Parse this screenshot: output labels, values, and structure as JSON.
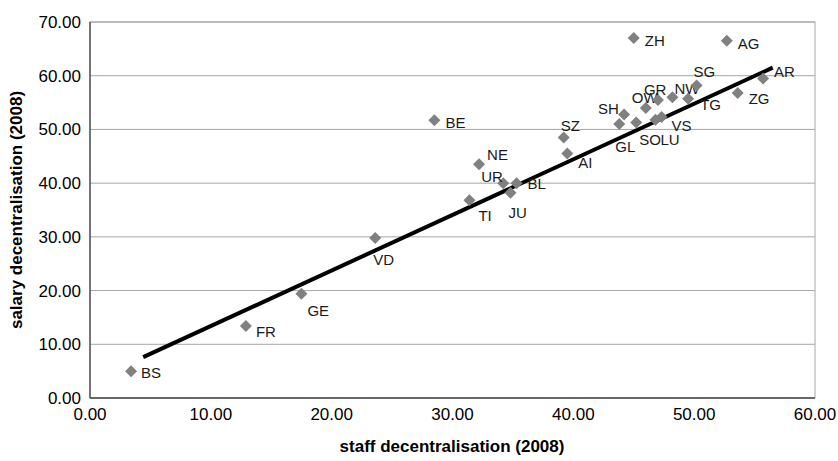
{
  "chart_data": {
    "type": "scatter",
    "title": "",
    "xlabel": "staff decentralisation (2008)",
    "ylabel": "salary decentralisation (2008)",
    "xlim": [
      0,
      60
    ],
    "ylim": [
      0,
      70
    ],
    "xticks": [
      "0.00",
      "10.00",
      "20.00",
      "30.00",
      "40.00",
      "50.00",
      "60.00"
    ],
    "yticks": [
      "0.00",
      "10.00",
      "20.00",
      "30.00",
      "40.00",
      "50.00",
      "60.00",
      "70.00"
    ],
    "xtick_values": [
      0,
      10,
      20,
      30,
      40,
      50,
      60
    ],
    "ytick_values": [
      0,
      10,
      20,
      30,
      40,
      50,
      60,
      70
    ],
    "grid": "horizontal",
    "legend": "none",
    "marker_shape": "diamond",
    "marker_color": "#808080",
    "trendline": {
      "color": "#000000",
      "x_start": 4.4,
      "y_start": 7.6,
      "x_end": 56.5,
      "y_end": 61.5
    },
    "points": [
      {
        "label": "BS",
        "x": 3.4,
        "y": 5.0,
        "lx": 10,
        "ly": 2
      },
      {
        "label": "FR",
        "x": 12.9,
        "y": 13.4,
        "lx": 10,
        "ly": 6
      },
      {
        "label": "GE",
        "x": 17.5,
        "y": 19.4,
        "lx": 6,
        "ly": 17
      },
      {
        "label": "VD",
        "x": 23.6,
        "y": 29.8,
        "lx": -2,
        "ly": 22
      },
      {
        "label": "BE",
        "x": 28.5,
        "y": 51.7,
        "lx": 11,
        "ly": 3
      },
      {
        "label": "TI",
        "x": 31.4,
        "y": 36.8,
        "lx": 9,
        "ly": 16
      },
      {
        "label": "NE",
        "x": 32.2,
        "y": 43.5,
        "lx": 8,
        "ly": -9
      },
      {
        "label": "UR",
        "x": 34.2,
        "y": 40.0,
        "lx": -22,
        "ly": -6
      },
      {
        "label": "JU",
        "x": 34.8,
        "y": 38.2,
        "lx": -2,
        "ly": 20
      },
      {
        "label": "BL",
        "x": 35.3,
        "y": 40.0,
        "lx": 11,
        "ly": 1
      },
      {
        "label": "SZ",
        "x": 39.2,
        "y": 48.5,
        "lx": -3,
        "ly": -11
      },
      {
        "label": "AI",
        "x": 39.5,
        "y": 45.5,
        "lx": 11,
        "ly": 9
      },
      {
        "label": "GL",
        "x": 43.8,
        "y": 51.0,
        "lx": -4,
        "ly": 23
      },
      {
        "label": "SH",
        "x": 44.2,
        "y": 52.8,
        "lx": -26,
        "ly": -5
      },
      {
        "label": "ZH",
        "x": 45.0,
        "y": 67.0,
        "lx": 11,
        "ly": 3
      },
      {
        "label": "SO",
        "x": 45.2,
        "y": 51.3,
        "lx": 3,
        "ly": 18
      },
      {
        "label": "OW",
        "x": 46.0,
        "y": 54.0,
        "lx": -14,
        "ly": -10
      },
      {
        "label": "LU",
        "x": 46.8,
        "y": 51.8,
        "lx": 5,
        "ly": 20
      },
      {
        "label": "GR",
        "x": 47.0,
        "y": 55.5,
        "lx": -14,
        "ly": -10
      },
      {
        "label": "VS",
        "x": 47.3,
        "y": 52.3,
        "lx": 10,
        "ly": 9
      },
      {
        "label": "NW",
        "x": 48.2,
        "y": 56.0,
        "lx": 2,
        "ly": -8
      },
      {
        "label": "TG",
        "x": 49.5,
        "y": 55.7,
        "lx": 12,
        "ly": 6
      },
      {
        "label": "SG",
        "x": 50.2,
        "y": 58.2,
        "lx": -3,
        "ly": -13
      },
      {
        "label": "AG",
        "x": 52.7,
        "y": 66.5,
        "lx": 11,
        "ly": 3
      },
      {
        "label": "ZG",
        "x": 53.6,
        "y": 56.8,
        "lx": 11,
        "ly": 6
      },
      {
        "label": "AR",
        "x": 55.7,
        "y": 59.5,
        "lx": 11,
        "ly": -6
      }
    ]
  }
}
